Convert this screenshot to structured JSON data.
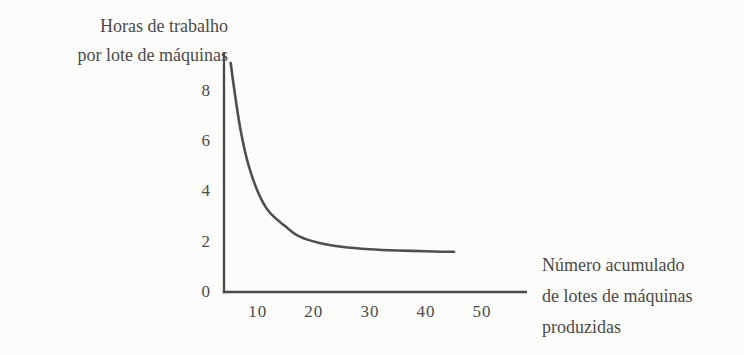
{
  "figure": {
    "y_axis_title_lines": [
      "Horas de trabalho",
      "por lote de máquinas"
    ],
    "x_axis_title_lines": [
      "Número acumulado",
      "de lotes de máquinas",
      "produzidas"
    ]
  },
  "colors": {
    "ink": "#4a4a4a",
    "curve": "#4f4f4f",
    "background": "#fcfcfa"
  },
  "chart_data": {
    "type": "line",
    "title": "",
    "ylabel": "Horas de trabalho por lote de máquinas",
    "xlabel": "Número acumulado de lotes de máquinas produzidas",
    "x_ticks": [
      10,
      20,
      30,
      40,
      50
    ],
    "y_ticks": [
      0,
      2,
      4,
      6,
      8
    ],
    "xlim": [
      4,
      58
    ],
    "ylim": [
      0,
      9.5
    ],
    "grid": false,
    "legend": null,
    "series": [
      {
        "name": "horas-por-lote-curva-de-aprendizagem",
        "points": [
          [
            5.2,
            9.1
          ],
          [
            5.8,
            8.1
          ],
          [
            6.9,
            6.5
          ],
          [
            8.3,
            5.1
          ],
          [
            10,
            4.0
          ],
          [
            12,
            3.2
          ],
          [
            15,
            2.6
          ],
          [
            17.5,
            2.2
          ],
          [
            21,
            1.95
          ],
          [
            25,
            1.8
          ],
          [
            30,
            1.7
          ],
          [
            35,
            1.65
          ],
          [
            40,
            1.62
          ],
          [
            45,
            1.6
          ]
        ]
      }
    ]
  }
}
